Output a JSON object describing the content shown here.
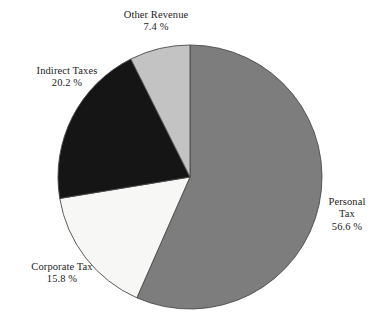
{
  "chart_data": {
    "type": "pie",
    "title": "",
    "subtitle": "",
    "xlabel": "",
    "ylabel": "",
    "legend_position": "none",
    "grid": false,
    "units": "percent",
    "start_angle_deg": 0,
    "direction": "clockwise",
    "categories": [
      "Personal Tax",
      "Corporate Tax",
      "Indirect Taxes",
      "Other Revenue"
    ],
    "values": [
      56.6,
      15.8,
      20.2,
      7.4
    ],
    "slices": [
      {
        "label": "Personal Tax",
        "label_line1": "Personal",
        "label_line2": "Tax",
        "value": 56.6,
        "value_text": "56.6 %",
        "color": "#7d7d7d",
        "start_deg": 0,
        "end_deg": 203.76
      },
      {
        "label": "Corporate Tax",
        "label_line1": "Corporate Tax",
        "label_line2": "",
        "value": 15.8,
        "value_text": "15.8 %",
        "color": "#f7f7f5",
        "start_deg": 203.76,
        "end_deg": 260.64
      },
      {
        "label": "Indirect Taxes",
        "label_line1": "Indirect Taxes",
        "label_line2": "",
        "value": 20.2,
        "value_text": "20.2 %",
        "color": "#151515",
        "start_deg": 260.64,
        "end_deg": 333.36
      },
      {
        "label": "Other Revenue",
        "label_line1": "Other Revenue",
        "label_line2": "",
        "value": 7.4,
        "value_text": "7.4 %",
        "color": "#c3c3c3",
        "start_deg": 333.36,
        "end_deg": 360
      }
    ],
    "geometry": {
      "center_x": 190,
      "center_y": 177,
      "radius": 132
    },
    "colors": {
      "background": "#ffffff",
      "outline": "#4a4a4a",
      "text": "#1c1c1c",
      "personal_tax": "#7d7d7d",
      "corporate_tax": "#f7f7f5",
      "indirect_taxes": "#151515",
      "other_revenue": "#c3c3c3"
    }
  },
  "labels": {
    "other_revenue": {
      "name": "Other Revenue",
      "value": "7.4 %"
    },
    "indirect_taxes": {
      "name": "Indirect Taxes",
      "value": "20.2 %"
    },
    "corporate_tax": {
      "name": "Corporate Tax",
      "value": "15.8 %"
    },
    "personal_tax": {
      "name_line1": "Personal",
      "name_line2": "Tax",
      "value": "56.6 %"
    }
  }
}
